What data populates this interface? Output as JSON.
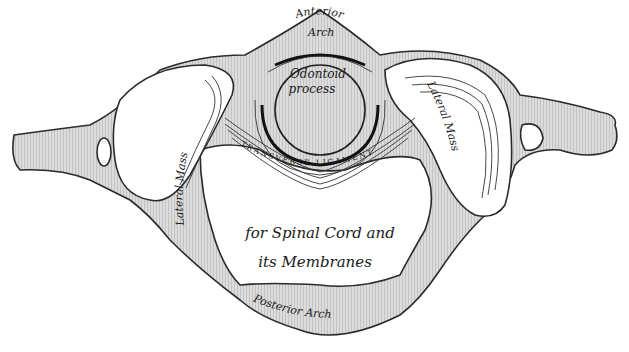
{
  "diagram": {
    "colors": {
      "bone_fill": "#d9d9d9",
      "hatch_line": "#bdbdbd",
      "outline": "#2a2a2a",
      "background": "#ffffff",
      "text": "#1a1a1a"
    },
    "labels": {
      "anterior_arch_line1": "Anterior",
      "anterior_arch_line2": "Arch",
      "odontoid_line1": "Odontoid",
      "odontoid_line2": "process",
      "transverse_ligament": "TRANSVERSE LIGAMENT",
      "lateral_mass_left": "Lateral Mass",
      "lateral_mass_right": "Lateral Mass",
      "foramen_line1": "for Spinal Cord and",
      "foramen_line2": "its Membranes",
      "posterior_arch": "Posterior Arch"
    }
  }
}
